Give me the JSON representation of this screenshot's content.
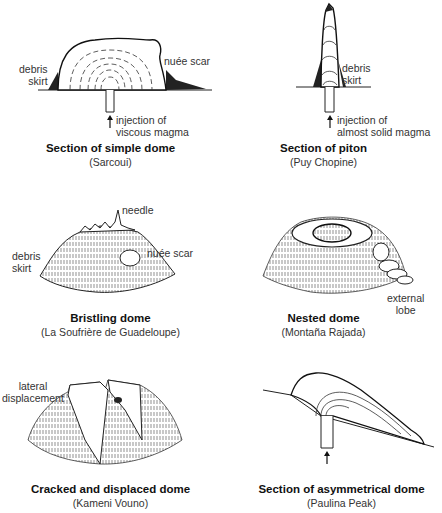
{
  "figure": {
    "panels": [
      {
        "id": "simple-dome",
        "title": "Section of simple dome",
        "subtitle": "(Sarcoui)",
        "labels": [
          "debris skirt",
          "nuée scar",
          "injection of viscous magma"
        ],
        "label_lines": {
          "debris": [
            "debris",
            "skirt"
          ],
          "scar": "nuée scar",
          "injection": [
            "injection of",
            "viscous magma"
          ]
        }
      },
      {
        "id": "piton",
        "title": "Section of piton",
        "subtitle": "(Puy Chopine)",
        "label_lines": {
          "debris": [
            "debris",
            "skirt"
          ],
          "injection": [
            "injection of",
            "almost solid magma"
          ]
        }
      },
      {
        "id": "bristling-dome",
        "title": "Bristling dome",
        "subtitle": "(La Soufrière de Guadeloupe)",
        "label_lines": {
          "needle": "needle",
          "debris": [
            "debris",
            "skirt"
          ],
          "scar": "nuée scar"
        }
      },
      {
        "id": "nested-dome",
        "title": "Nested dome",
        "subtitle": "(Montaña Rajada)",
        "label_lines": {
          "lobe": [
            "external",
            "lobe"
          ]
        }
      },
      {
        "id": "cracked-dome",
        "title": "Cracked and displaced dome",
        "subtitle": "(Kameni Vouno)",
        "label_lines": {
          "displacement": [
            "lateral",
            "displacement"
          ]
        }
      },
      {
        "id": "asymmetrical-dome",
        "title": "Section of asymmetrical dome",
        "subtitle": "(Paulina Peak)",
        "label_lines": {}
      }
    ]
  }
}
